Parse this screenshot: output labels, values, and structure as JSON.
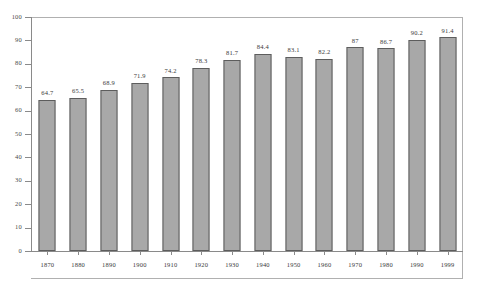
{
  "chart_data": {
    "type": "bar",
    "title": "",
    "subtitle": "",
    "xlabel": "",
    "ylabel": "",
    "categories": [
      "1870",
      "1880",
      "1890",
      "1900",
      "1910",
      "1920",
      "1930",
      "1940",
      "1950",
      "1960",
      "1970",
      "1980",
      "1990",
      "1999"
    ],
    "values": [
      64.7,
      65.5,
      68.9,
      71.9,
      74.2,
      78.3,
      81.7,
      84.4,
      83.1,
      82.2,
      87,
      86.7,
      90.2,
      91.4
    ],
    "value_labels": [
      "64.7",
      "65.5",
      "68.9",
      "71.9",
      "74.2",
      "78.3",
      "81.7",
      "84.4",
      "83.1",
      "82.2",
      "87",
      "86.7",
      "90.2",
      "91.4"
    ],
    "ylim": [
      0,
      100
    ],
    "ytick_labels": [
      "0",
      "10",
      "20",
      "30",
      "40",
      "50",
      "60",
      "70",
      "80",
      "90",
      "100"
    ],
    "ytick_values": [
      0,
      10,
      20,
      30,
      40,
      50,
      60,
      70,
      80,
      90,
      100
    ],
    "grid": false,
    "legend": null,
    "bar_color": "#a8a8a8",
    "bar_border_color": "#5d5d5d",
    "axis_color": "#8a8a8a",
    "frame_color": "#b0b0b0",
    "text_color": "#3a3a3a",
    "background": "#ffffff"
  }
}
